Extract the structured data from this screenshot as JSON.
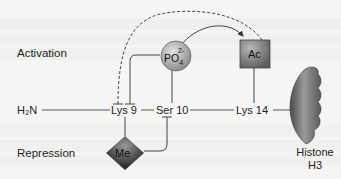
{
  "diagram": {
    "labels": {
      "activation": "Activation",
      "repression": "Repression",
      "n_terminus": "H₂N",
      "lys9": "Lys 9",
      "ser10": "Ser 10",
      "lys14": "Lys 14",
      "histone_line1": "Histone",
      "histone_line2": "H3"
    },
    "modifications": {
      "phosphate": {
        "label": "PO",
        "subscript": "4",
        "superscript": "2-",
        "shape": "circle",
        "color": "#a8a8a8"
      },
      "acetyl": {
        "label": "Ac",
        "shape": "square",
        "color": "#7a7a7a"
      },
      "methyl": {
        "label": "Me",
        "shape": "diamond",
        "color": "#3a3a3a"
      }
    },
    "edges": [
      {
        "from": "phosphate",
        "to": "acetyl",
        "type": "activates",
        "style": "solid-arrow"
      },
      {
        "from": "acetyl",
        "to": "lys9",
        "type": "inhibits",
        "style": "dashed-tbar"
      },
      {
        "from": "phosphate",
        "to": "lys9",
        "type": "inhibits",
        "style": "solid-tbar"
      },
      {
        "from": "methyl",
        "to": "ser10",
        "type": "inhibits",
        "style": "solid-tbar"
      }
    ],
    "colors": {
      "line": "#444444",
      "text": "#222222",
      "histone": "#6a6a6a"
    }
  }
}
